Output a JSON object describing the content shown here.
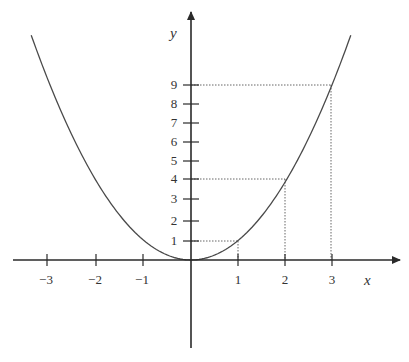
{
  "chart_data": {
    "type": "line",
    "title": "",
    "function": "y = x^2",
    "xlabel": "x",
    "ylabel": "y",
    "x_ticks": [
      -3,
      -2,
      -1,
      1,
      2,
      3
    ],
    "y_ticks": [
      1,
      2,
      3,
      4,
      5,
      6,
      7,
      8,
      9
    ],
    "xlim": [
      -3.4,
      4.5
    ],
    "ylim": [
      -4.5,
      13
    ],
    "grid": false,
    "series": [
      {
        "name": "y = x^2",
        "x": [
          -3.4,
          -3,
          -2,
          -1,
          0,
          1,
          2,
          3,
          3.4
        ],
        "y": [
          11.56,
          9,
          4,
          1,
          0,
          1,
          4,
          9,
          11.56
        ]
      }
    ],
    "highlighted_points": [
      {
        "x": 1,
        "y": 1
      },
      {
        "x": 2,
        "y": 4
      },
      {
        "x": 3,
        "y": 9
      }
    ],
    "projection_lines": "dotted"
  },
  "labels": {
    "x_axis": "x",
    "y_axis": "y",
    "x_ticks": [
      "−3",
      "−2",
      "−1",
      "1",
      "2",
      "3"
    ],
    "y_ticks": [
      "1",
      "2",
      "3",
      "4",
      "5",
      "6",
      "7",
      "8",
      "9"
    ]
  },
  "colors": {
    "axis": "#2a2a2a",
    "curve": "#4a4a4a",
    "guide": "#555555"
  }
}
